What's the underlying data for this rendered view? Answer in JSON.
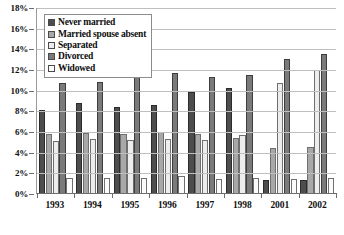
{
  "chart_data": {
    "type": "bar",
    "title": "",
    "subtitle": "",
    "xlabel": "",
    "ylabel": "",
    "ylim": [
      0,
      18
    ],
    "ytick_step": 2,
    "ytick_labels": [
      "0%",
      "2%",
      "4%",
      "6%",
      "8%",
      "10%",
      "12%",
      "14%",
      "16%",
      "18%"
    ],
    "grid": true,
    "legend_position": "top-left-inside",
    "categories": [
      "1993",
      "1994",
      "1995",
      "1996",
      "1997",
      "1998",
      "2001",
      "2002"
    ],
    "series": [
      {
        "name": "Never married",
        "color": "#4d4d4d",
        "values": [
          8.0,
          8.7,
          8.3,
          8.5,
          9.8,
          10.2,
          1.3,
          1.3
        ]
      },
      {
        "name": "Married spouse absent",
        "color": "#a8a8a8",
        "values": [
          5.7,
          5.8,
          5.7,
          5.9,
          5.7,
          5.3,
          4.4,
          4.5
        ]
      },
      {
        "name": "Separated",
        "color": "#ededed",
        "values": [
          5.0,
          5.2,
          5.1,
          5.2,
          5.1,
          5.6,
          10.6,
          11.9
        ]
      },
      {
        "name": "Divorced",
        "color": "#7a7a7a",
        "values": [
          10.6,
          10.7,
          11.3,
          11.6,
          11.2,
          11.4,
          13.0,
          13.5
        ]
      },
      {
        "name": "Widowed",
        "color": "#fbfbfb",
        "values": [
          1.5,
          1.5,
          1.5,
          1.6,
          1.4,
          1.5,
          1.4,
          1.5
        ]
      }
    ]
  },
  "legend": {
    "items": [
      {
        "label": "Never married"
      },
      {
        "label": "Married spouse absent"
      },
      {
        "label": "Separated"
      },
      {
        "label": "Divorced"
      },
      {
        "label": "Widowed"
      }
    ]
  }
}
